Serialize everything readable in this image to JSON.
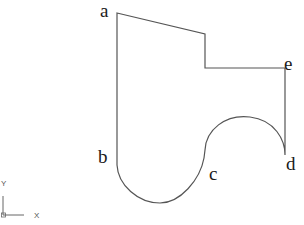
{
  "diagram": {
    "stroke_color": "#555555",
    "points": {
      "a": {
        "label": "a"
      },
      "b": {
        "label": "b"
      },
      "c": {
        "label": "c"
      },
      "d": {
        "label": "d"
      },
      "e": {
        "label": "e"
      }
    },
    "axis_icon": {
      "x_label": "X",
      "y_label": "Y"
    }
  }
}
